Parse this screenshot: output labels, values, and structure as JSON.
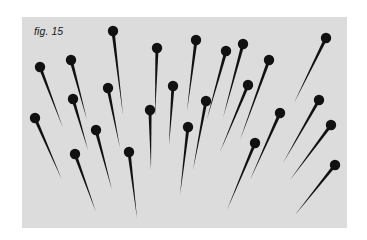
{
  "figure": {
    "caption": "fig. 15",
    "colors": {
      "background": "#dcdcdc",
      "pin": "#111111",
      "page": "#ffffff"
    },
    "pins": [
      {
        "head": [
          40,
          67
        ],
        "tip": [
          63,
          128
        ]
      },
      {
        "head": [
          71,
          60
        ],
        "tip": [
          87,
          120
        ]
      },
      {
        "head": [
          113,
          31
        ],
        "tip": [
          123,
          115
        ]
      },
      {
        "head": [
          73,
          99
        ],
        "tip": [
          88,
          150
        ]
      },
      {
        "head": [
          108,
          88
        ],
        "tip": [
          120,
          148
        ]
      },
      {
        "head": [
          35,
          118
        ],
        "tip": [
          62,
          180
        ]
      },
      {
        "head": [
          75,
          154
        ],
        "tip": [
          96,
          212
        ]
      },
      {
        "head": [
          96,
          130
        ],
        "tip": [
          112,
          190
        ]
      },
      {
        "head": [
          129,
          152
        ],
        "tip": [
          137,
          218
        ]
      },
      {
        "head": [
          157,
          48
        ],
        "tip": [
          155,
          116
        ]
      },
      {
        "head": [
          150,
          110
        ],
        "tip": [
          151,
          170
        ]
      },
      {
        "head": [
          173,
          86
        ],
        "tip": [
          169,
          145
        ]
      },
      {
        "head": [
          188,
          127
        ],
        "tip": [
          180,
          195
        ]
      },
      {
        "head": [
          196,
          40
        ],
        "tip": [
          187,
          111
        ]
      },
      {
        "head": [
          206,
          101
        ],
        "tip": [
          193,
          170
        ]
      },
      {
        "head": [
          226,
          51
        ],
        "tip": [
          207,
          119
        ]
      },
      {
        "head": [
          243,
          44
        ],
        "tip": [
          223,
          118
        ]
      },
      {
        "head": [
          248,
          85
        ],
        "tip": [
          220,
          152
        ]
      },
      {
        "head": [
          269,
          60
        ],
        "tip": [
          240,
          140
        ]
      },
      {
        "head": [
          326,
          38
        ],
        "tip": [
          294,
          103
        ]
      },
      {
        "head": [
          280,
          113
        ],
        "tip": [
          250,
          180
        ]
      },
      {
        "head": [
          255,
          143
        ],
        "tip": [
          227,
          210
        ]
      },
      {
        "head": [
          319,
          100
        ],
        "tip": [
          283,
          163
        ]
      },
      {
        "head": [
          331,
          125
        ],
        "tip": [
          290,
          180
        ]
      },
      {
        "head": [
          335,
          165
        ],
        "tip": [
          295,
          215
        ]
      }
    ]
  }
}
